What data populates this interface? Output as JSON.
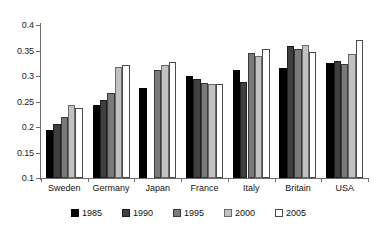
{
  "chart_data": {
    "type": "bar",
    "title": "",
    "xlabel": "",
    "ylabel": "",
    "ylim": [
      0.1,
      0.4
    ],
    "yticks": [
      "0.1",
      "0.15",
      "0.2",
      "0.25",
      "0.3",
      "0.35",
      "0.4"
    ],
    "ytick_values": [
      0.1,
      0.15,
      0.2,
      0.25,
      0.3,
      0.35,
      0.4
    ],
    "grid": false,
    "legend_position": "bottom",
    "categories": [
      "Sweden",
      "Germany",
      "Japan",
      "France",
      "Italy",
      "Britain",
      "USA"
    ],
    "series": [
      {
        "name": "1985",
        "color": "#000000",
        "values": [
          0.195,
          0.244,
          0.277,
          0.3,
          0.311,
          0.315,
          0.325
        ]
      },
      {
        "name": "1990",
        "color": "#3f3f3f",
        "values": [
          0.205,
          0.253,
          null,
          0.294,
          0.289,
          0.358,
          0.329
        ]
      },
      {
        "name": "1995",
        "color": "#7a7a7a",
        "values": [
          0.22,
          0.266,
          0.312,
          0.286,
          0.345,
          0.352,
          0.323
        ]
      },
      {
        "name": "2000",
        "color": "#c2c2c2",
        "values": [
          0.243,
          0.318,
          0.322,
          0.284,
          0.34,
          0.36,
          0.343
        ]
      },
      {
        "name": "2005",
        "color": "#ffffff",
        "values": [
          0.237,
          0.322,
          0.327,
          0.285,
          0.352,
          0.347,
          0.37
        ]
      }
    ]
  },
  "legend": {
    "items": [
      {
        "label": "1985"
      },
      {
        "label": "1990"
      },
      {
        "label": "1995"
      },
      {
        "label": "2000"
      },
      {
        "label": "2005"
      }
    ]
  }
}
